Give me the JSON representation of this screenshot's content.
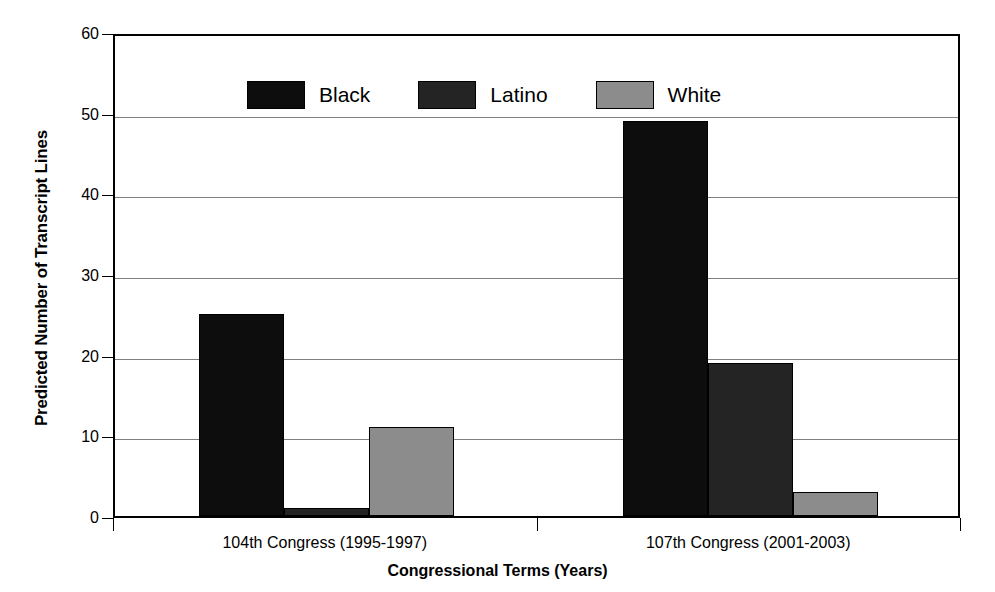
{
  "chart_data": {
    "type": "bar",
    "title": "",
    "xlabel": "Congressional Terms (Years)",
    "ylabel": "Predicted Number of Transcript Lines",
    "categories": [
      "104th Congress (1995-1997)",
      "107th Congress (2001-2003)"
    ],
    "series": [
      {
        "name": "Black",
        "color": "#0d0d0d",
        "values": [
          25,
          49
        ]
      },
      {
        "name": "Latino",
        "color": "#242424",
        "values": [
          1,
          19
        ]
      },
      {
        "name": "White",
        "color": "#8c8c8c",
        "values": [
          11,
          3
        ]
      }
    ],
    "ylim": [
      0,
      60
    ],
    "yticks": [
      0,
      10,
      20,
      30,
      40,
      50,
      60
    ],
    "ytick_labels": [
      "0",
      "10",
      "20",
      "30",
      "40",
      "50",
      "60"
    ],
    "grid": "horizontal",
    "legend_position": "top-left-inside",
    "legend_entries": [
      "Black",
      "Latino",
      "White"
    ]
  },
  "axis": {
    "y_title": "Predicted Number of Transcript Lines",
    "x_title": "Congressional Terms (Years)"
  },
  "legend": {
    "items": [
      {
        "label": "Black"
      },
      {
        "label": "Latino"
      },
      {
        "label": "White"
      }
    ]
  },
  "xticks": {
    "labels": [
      "104th Congress (1995-1997)",
      "107th Congress (2001-2003)"
    ]
  },
  "yticks": {
    "labels": [
      "60",
      "50",
      "40",
      "30",
      "20",
      "10",
      "0"
    ]
  }
}
